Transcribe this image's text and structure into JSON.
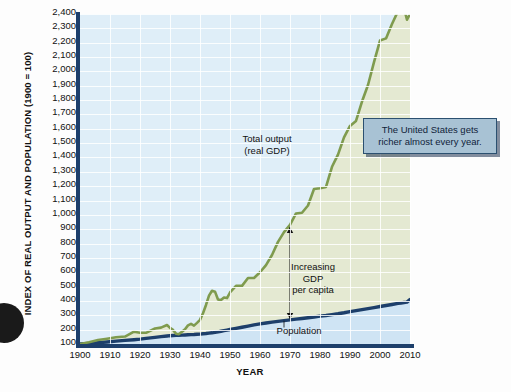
{
  "chart_data": {
    "type": "line",
    "title": "",
    "xlabel": "YEAR",
    "ylabel": "INDEX OF REAL OUTPUT AND POPULATION (1900 = 100)",
    "xlim": [
      1900,
      2010
    ],
    "ylim": [
      100,
      2400
    ],
    "grid": true,
    "legend_position": "inline-annotations",
    "xticks": [
      "1900",
      "1910",
      "1920",
      "1930",
      "1940",
      "1950",
      "1960",
      "1970",
      "1980",
      "1990",
      "2000",
      "2010"
    ],
    "yticks": [
      "100",
      "200",
      "300",
      "400",
      "500",
      "600",
      "700",
      "800",
      "900",
      "1,000",
      "1,100",
      "1,200",
      "1,300",
      "1,400",
      "1,500",
      "1,600",
      "1,700",
      "1,800",
      "1,900",
      "2,000",
      "2,100",
      "2,200",
      "2,300",
      "2,400"
    ],
    "x": [
      1900,
      1903,
      1906,
      1909,
      1912,
      1915,
      1918,
      1920,
      1922,
      1925,
      1927,
      1929,
      1930,
      1931,
      1932,
      1933,
      1934,
      1935,
      1936,
      1937,
      1938,
      1939,
      1940,
      1941,
      1942,
      1943,
      1944,
      1945,
      1946,
      1947,
      1948,
      1949,
      1950,
      1952,
      1954,
      1956,
      1958,
      1960,
      1962,
      1964,
      1966,
      1968,
      1970,
      1972,
      1974,
      1976,
      1978,
      1980,
      1982,
      1984,
      1986,
      1988,
      1990,
      1992,
      1994,
      1996,
      1998,
      2000,
      2002,
      2004,
      2006,
      2007,
      2008,
      2009,
      2010
    ],
    "series": [
      {
        "name": "Total output (real GDP)",
        "color": "#7f9b4e",
        "fill": "#e4e9d2",
        "values": [
          100,
          112,
          128,
          137,
          147,
          152,
          186,
          178,
          178,
          208,
          214,
          232,
          212,
          198,
          172,
          169,
          186,
          203,
          230,
          240,
          228,
          247,
          268,
          314,
          372,
          437,
          471,
          465,
          410,
          406,
          424,
          420,
          459,
          505,
          505,
          560,
          560,
          600,
          650,
          720,
          812,
          880,
          930,
          1010,
          1015,
          1065,
          1180,
          1185,
          1195,
          1335,
          1420,
          1540,
          1620,
          1655,
          1790,
          1905,
          2065,
          2215,
          2230,
          2330,
          2420,
          2460,
          2440,
          2360,
          2400
        ]
      },
      {
        "name": "Population",
        "color": "#1d3f6b",
        "values": [
          100,
          104,
          109,
          114,
          120,
          125,
          130,
          134,
          139,
          146,
          151,
          156,
          158,
          159,
          160,
          161,
          162,
          163,
          164,
          165,
          166,
          168,
          169,
          171,
          173,
          176,
          178,
          181,
          185,
          189,
          193,
          197,
          201,
          209,
          217,
          225,
          233,
          240,
          246,
          252,
          258,
          263,
          268,
          273,
          278,
          283,
          288,
          294,
          299,
          305,
          311,
          318,
          326,
          333,
          340,
          347,
          354,
          361,
          368,
          375,
          383,
          386,
          389,
          392,
          410
        ]
      }
    ],
    "annotations": [
      {
        "name": "gdp-label",
        "text": "Total output\n(real GDP)"
      },
      {
        "name": "per-capita-label",
        "text": "Increasing\nGDP\nper capita"
      },
      {
        "name": "population-label",
        "text": "Population"
      }
    ]
  },
  "callout": {
    "text": "The United States gets\nricher almost every year."
  },
  "axes": {
    "y_title": "INDEX OF REAL OUTPUT AND POPULATION (1900 = 100)",
    "x_title": "YEAR"
  },
  "colors": {
    "gdp_line": "#7f9b4e",
    "gdp_fill": "#e4e9d2",
    "population_line": "#1d3f6b",
    "plot_background": "#dfeef8",
    "grid": "#ffffff",
    "callout_bg": "#a8c2d4",
    "callout_border": "#2b5070"
  }
}
